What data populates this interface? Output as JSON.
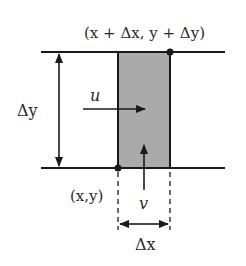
{
  "diagram": {
    "labels": {
      "top_corner": "(x + Δx, y + Δy)",
      "bottom_corner": "(x,y)",
      "delta_y": "Δy",
      "delta_x": "Δx",
      "u": "u",
      "v": "v"
    },
    "colors": {
      "line": "#1a1a1a",
      "cell_fill": "#aaaaaa",
      "text": "#2a2a2a"
    }
  }
}
